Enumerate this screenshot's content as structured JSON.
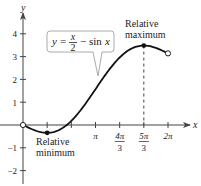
{
  "chart_data": {
    "type": "line",
    "title": "",
    "xlabel": "x",
    "ylabel": "y",
    "xlim": [
      -0.75,
      6.9
    ],
    "ylim": [
      -2.4,
      5.2
    ],
    "grid": false,
    "equation_label": {
      "prefix": "y =",
      "num": "x",
      "den": "2",
      "suffix": "− sin x"
    },
    "function": "y = x/2 - sin x",
    "domain": [
      0,
      6.2832
    ],
    "x_ticks": [
      {
        "value": 1.0472,
        "label_num": "",
        "label_den": ""
      },
      {
        "value": 2.0944,
        "label_num": "",
        "label_den": ""
      },
      {
        "value": 3.1416,
        "label_num": "π",
        "label_den": ""
      },
      {
        "value": 4.1888,
        "label_num": "4π",
        "label_den": "3"
      },
      {
        "value": 5.236,
        "label_num": "5π",
        "label_den": "3"
      },
      {
        "value": 6.2832,
        "label_num": "2π",
        "label_den": ""
      }
    ],
    "y_ticks": [
      {
        "value": 4,
        "label": "4"
      },
      {
        "value": 3,
        "label": "3"
      },
      {
        "value": 2,
        "label": "2"
      },
      {
        "value": 1,
        "label": "1"
      },
      {
        "value": -1,
        "label": "−1"
      },
      {
        "value": -2,
        "label": "−2"
      }
    ],
    "endpoints": [
      {
        "x": 0,
        "y": 0,
        "open": true
      },
      {
        "x": 6.2832,
        "y": 3.1416,
        "open": true
      }
    ],
    "annotations": [
      {
        "name": "relative-maximum",
        "x": 5.236,
        "y": 3.484,
        "lines": [
          "Relative",
          "maximum"
        ]
      },
      {
        "name": "relative-minimum",
        "x": 1.0472,
        "y": -0.3424,
        "lines": [
          "Relative",
          "minimum"
        ]
      }
    ]
  }
}
